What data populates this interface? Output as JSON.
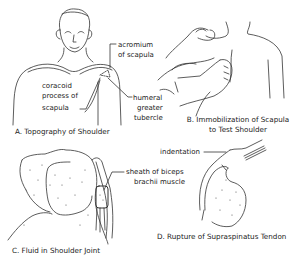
{
  "panels": [
    {
      "id": "A",
      "caption": "A. Topography of Shoulder",
      "labels": {
        "acromium_1": "acromium",
        "acromium_2": "of scapula",
        "coracoid_1": "coracoid",
        "coracoid_2": "process of",
        "coracoid_3": "scapula",
        "humeral_1": "humeral",
        "humeral_2": "greater",
        "humeral_3": "tubercle"
      }
    },
    {
      "id": "B",
      "caption_1": "B. Immobilization of Scapula",
      "caption_2": "to Test Shoulder"
    },
    {
      "id": "C",
      "caption": "C. Fluid in Shoulder Joint",
      "labels": {
        "sheath_1": "sheath of biceps",
        "sheath_2": "brachii muscle"
      }
    },
    {
      "id": "D",
      "caption": "D. Rupture of Supraspinatus Tendon",
      "labels": {
        "indentation": "indentation"
      }
    }
  ],
  "colors": {
    "line": "#333333",
    "background": "#ffffff"
  }
}
